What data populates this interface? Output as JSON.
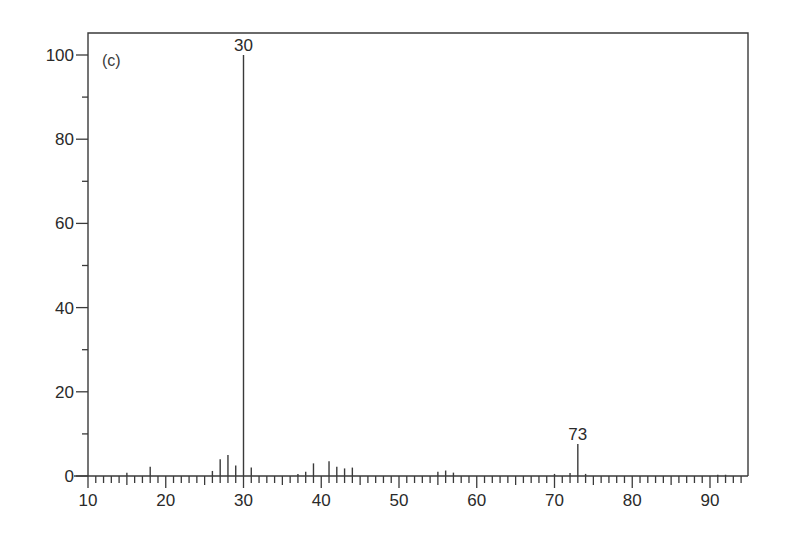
{
  "chart_data": {
    "type": "bar",
    "subtype": "mass-spectrum-stick",
    "title": "",
    "panel_label": "(c)",
    "xlabel": "",
    "ylabel": "",
    "xlim": [
      10,
      95
    ],
    "ylim": [
      0,
      100
    ],
    "grid": false,
    "legend": null,
    "x_ticks": [
      10,
      20,
      30,
      40,
      50,
      60,
      70,
      80,
      90
    ],
    "x_tick_labels": [
      "10",
      "20",
      "30",
      "40",
      "50",
      "60",
      "70",
      "80",
      "90"
    ],
    "x_minor_step": 1,
    "y_ticks": [
      0,
      20,
      40,
      60,
      80,
      100
    ],
    "y_tick_labels": [
      "0",
      "20",
      "40",
      "60",
      "80",
      "100"
    ],
    "y_minor_ticks": [
      10,
      30,
      50,
      70,
      90
    ],
    "peaks": [
      {
        "mz": 15,
        "intensity": 0.8
      },
      {
        "mz": 18,
        "intensity": 2.2
      },
      {
        "mz": 26,
        "intensity": 1.2
      },
      {
        "mz": 27,
        "intensity": 4.0
      },
      {
        "mz": 28,
        "intensity": 5.0
      },
      {
        "mz": 29,
        "intensity": 2.5
      },
      {
        "mz": 30,
        "intensity": 100
      },
      {
        "mz": 31,
        "intensity": 2.0
      },
      {
        "mz": 37,
        "intensity": 0.5
      },
      {
        "mz": 38,
        "intensity": 1.0
      },
      {
        "mz": 39,
        "intensity": 3.0
      },
      {
        "mz": 41,
        "intensity": 3.5
      },
      {
        "mz": 42,
        "intensity": 2.2
      },
      {
        "mz": 43,
        "intensity": 1.8
      },
      {
        "mz": 44,
        "intensity": 2.0
      },
      {
        "mz": 55,
        "intensity": 1.0
      },
      {
        "mz": 56,
        "intensity": 1.3
      },
      {
        "mz": 57,
        "intensity": 0.8
      },
      {
        "mz": 70,
        "intensity": 0.5
      },
      {
        "mz": 72,
        "intensity": 0.7
      },
      {
        "mz": 73,
        "intensity": 7.6
      },
      {
        "mz": 74,
        "intensity": 0.5
      },
      {
        "mz": 91,
        "intensity": 0.3
      },
      {
        "mz": 92,
        "intensity": 0.3
      }
    ],
    "annotations": [
      {
        "mz": 30,
        "text": "30"
      },
      {
        "mz": 73,
        "text": "73"
      }
    ]
  }
}
